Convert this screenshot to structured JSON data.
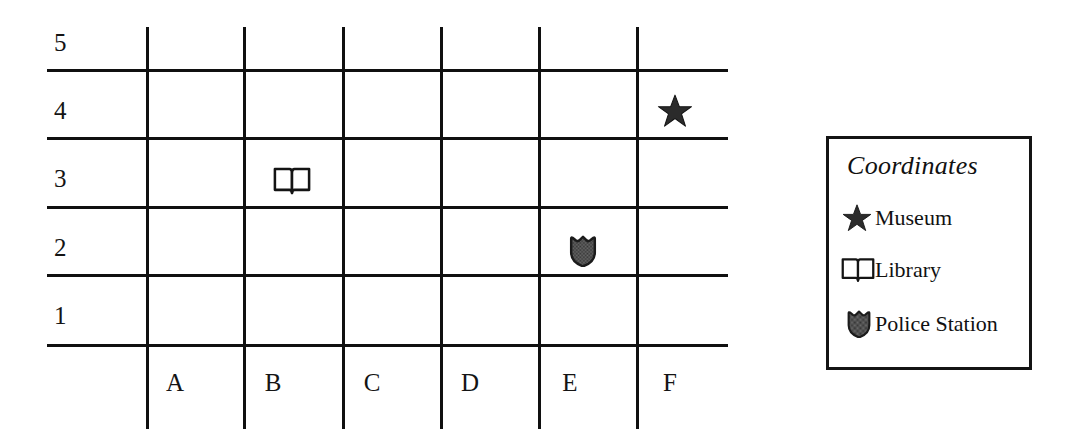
{
  "map": {
    "name": "coordinate-grid-map",
    "columns": [
      "A",
      "B",
      "C",
      "D",
      "E",
      "F"
    ],
    "rows": [
      "5",
      "4",
      "3",
      "2",
      "1"
    ],
    "grid": {
      "line_color": "#101010",
      "columns_count": 6,
      "rows_count": 5
    },
    "markers": [
      {
        "icon": "star-icon",
        "label": "Museum",
        "column": "F",
        "row": "4",
        "coordinate": "F4",
        "fill": "#2b2b2b"
      },
      {
        "icon": "book-icon",
        "label": "Library",
        "column": "B",
        "row": "3",
        "coordinate": "B3",
        "fill": "#ffffff"
      },
      {
        "icon": "shield-icon",
        "label": "Police Station",
        "column": "E",
        "row": "2",
        "coordinate": "E2",
        "fill": "#5a5a5a"
      }
    ]
  },
  "legend": {
    "title": "Coordinates",
    "border_color": "#141414",
    "items": [
      {
        "icon": "star-icon",
        "label": "Museum"
      },
      {
        "icon": "book-icon",
        "label": "Library"
      },
      {
        "icon": "shield-icon",
        "label": "Police Station"
      }
    ]
  }
}
